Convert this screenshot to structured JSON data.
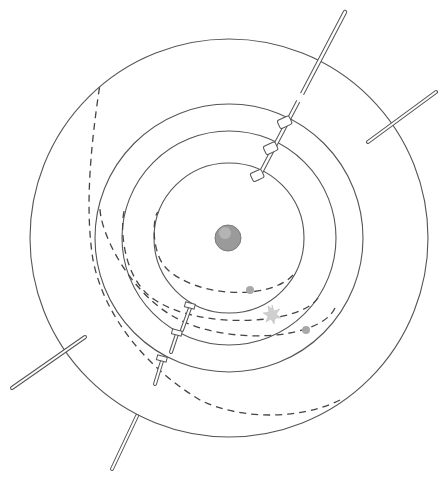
{
  "diagram": {
    "title": "Orbital transfer diagram",
    "center": {
      "x": 229,
      "y": 238
    },
    "central_body": {
      "radius": 13,
      "color": "#9a9a9a",
      "label": "central-body"
    },
    "orbits": [
      {
        "name": "orbit-1",
        "radius": 75
      },
      {
        "name": "orbit-2",
        "radius": 107
      },
      {
        "name": "orbit-3",
        "radius": 134
      },
      {
        "name": "orbit-4",
        "radius": 199
      }
    ],
    "markers": [
      {
        "name": "body-marker-1",
        "x": 250,
        "y": 290,
        "type": "dot",
        "color": "#a8a8a8"
      },
      {
        "name": "starburst-marker",
        "x": 272,
        "y": 315,
        "type": "star",
        "color": "#c8c8c8"
      },
      {
        "name": "body-marker-2",
        "x": 306,
        "y": 330,
        "type": "dot",
        "color": "#a8a8a8"
      }
    ],
    "colors": {
      "line": "#555555",
      "dashed": "#444444",
      "background": "#ffffff"
    }
  }
}
